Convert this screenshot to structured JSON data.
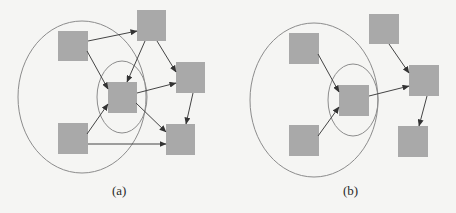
{
  "colors": {
    "background": "#f5f5f3",
    "node_fill": "#a9a9a9",
    "edge": "#444444",
    "ellipse_stroke": "#8c8c8c"
  },
  "panels": [
    {
      "id": "a",
      "label": "(a)",
      "label_pos": {
        "x": 112,
        "y": 184
      },
      "outer_ellipse": {
        "cx": 82,
        "cy": 97,
        "rx": 64,
        "ry": 76
      },
      "inner_ellipse": {
        "cx": 122,
        "cy": 97,
        "rx": 25,
        "ry": 36
      },
      "nodes": [
        {
          "id": "a1",
          "name": "top-left-node",
          "x": 58,
          "y": 31,
          "w": 30,
          "h": 30
        },
        {
          "id": "a2",
          "name": "top-node",
          "x": 137,
          "y": 10,
          "w": 29,
          "h": 31
        },
        {
          "id": "a3",
          "name": "right-node",
          "x": 176,
          "y": 62,
          "w": 29,
          "h": 31
        },
        {
          "id": "a4",
          "name": "center-node",
          "x": 108,
          "y": 82,
          "w": 29,
          "h": 31
        },
        {
          "id": "a5",
          "name": "bottom-left-node",
          "x": 58,
          "y": 123,
          "w": 30,
          "h": 31
        },
        {
          "id": "a6",
          "name": "bottom-right-node",
          "x": 166,
          "y": 124,
          "w": 29,
          "h": 31
        }
      ],
      "edges": [
        {
          "from": "a1",
          "to": "a2",
          "x1": 88,
          "y1": 41,
          "x2": 137,
          "y2": 31
        },
        {
          "from": "a1",
          "to": "a4",
          "x1": 87,
          "y1": 51,
          "x2": 108,
          "y2": 89
        },
        {
          "from": "a2",
          "to": "a4",
          "x1": 145,
          "y1": 41,
          "x2": 127,
          "y2": 82
        },
        {
          "from": "a2",
          "to": "a3",
          "x1": 157,
          "y1": 41,
          "x2": 176,
          "y2": 72
        },
        {
          "from": "a4",
          "to": "a3",
          "x1": 137,
          "y1": 93,
          "x2": 176,
          "y2": 83
        },
        {
          "from": "a4",
          "to": "a6",
          "x1": 136,
          "y1": 103,
          "x2": 166,
          "y2": 132
        },
        {
          "from": "a5",
          "to": "a4",
          "x1": 87,
          "y1": 134,
          "x2": 108,
          "y2": 104
        },
        {
          "from": "a5",
          "to": "a6",
          "x1": 88,
          "y1": 144,
          "x2": 166,
          "y2": 144
        },
        {
          "from": "a3",
          "to": "a6",
          "x1": 193,
          "y1": 93,
          "x2": 186,
          "y2": 124
        }
      ]
    },
    {
      "id": "b",
      "label": "(b)",
      "label_pos": {
        "x": 343,
        "y": 184
      },
      "outer_ellipse": {
        "cx": 314,
        "cy": 100,
        "rx": 64,
        "ry": 77
      },
      "inner_ellipse": {
        "cx": 353,
        "cy": 100,
        "rx": 25,
        "ry": 36
      },
      "nodes": [
        {
          "id": "b1",
          "name": "top-left-node",
          "x": 289,
          "y": 33,
          "w": 30,
          "h": 31
        },
        {
          "id": "b2",
          "name": "top-node",
          "x": 369,
          "y": 14,
          "w": 30,
          "h": 30
        },
        {
          "id": "b3",
          "name": "right-node",
          "x": 409,
          "y": 65,
          "w": 30,
          "h": 31
        },
        {
          "id": "b4",
          "name": "center-node",
          "x": 339,
          "y": 85,
          "w": 30,
          "h": 31
        },
        {
          "id": "b5",
          "name": "bottom-left-node",
          "x": 289,
          "y": 125,
          "w": 30,
          "h": 31
        },
        {
          "id": "b6",
          "name": "bottom-right-node",
          "x": 398,
          "y": 126,
          "w": 30,
          "h": 31
        }
      ],
      "edges": [
        {
          "from": "b1",
          "to": "b4",
          "x1": 318,
          "y1": 54,
          "x2": 339,
          "y2": 92
        },
        {
          "from": "b5",
          "to": "b4",
          "x1": 318,
          "y1": 136,
          "x2": 339,
          "y2": 107
        },
        {
          "from": "b4",
          "to": "b3",
          "x1": 369,
          "y1": 96,
          "x2": 409,
          "y2": 86
        },
        {
          "from": "b2",
          "to": "b3",
          "x1": 389,
          "y1": 44,
          "x2": 409,
          "y2": 73
        },
        {
          "from": "b3",
          "to": "b6",
          "x1": 427,
          "y1": 96,
          "x2": 419,
          "y2": 126
        }
      ]
    }
  ]
}
